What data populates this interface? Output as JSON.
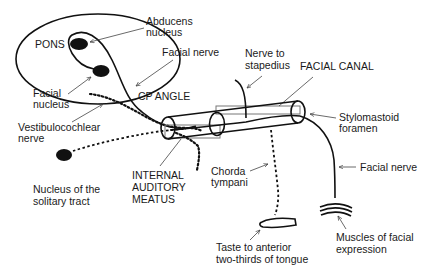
{
  "diagram": {
    "labels": {
      "pons": "PONS",
      "abducens_1": "Abducens",
      "abducens_2": "nucleus",
      "facial_nerve_top": "Facial nerve",
      "facial_nucleus_1": "Facial",
      "facial_nucleus_2": "nucleus",
      "cp_angle": "CP ANGLE",
      "vestibulocochlear_1": "Vestibulocochlear",
      "vestibulocochlear_2": "nerve",
      "solitary_1": "Nucleus of the",
      "solitary_2": "solitary tract",
      "iam_1": "INTERNAL",
      "iam_2": "AUDITORY",
      "iam_3": "MEATUS",
      "stapedius_1": "Nerve to",
      "stapedius_2": "stapedius",
      "facial_canal": "FACIAL CANAL",
      "stylomastoid_1": "Stylomastoid",
      "stylomastoid_2": "foramen",
      "chorda_1": "Chorda",
      "chorda_2": "tympani",
      "facial_nerve_right": "Facial nerve",
      "taste_1": "Taste to anterior",
      "taste_2": "two-thirds of tongue",
      "muscles_1": "Muscles of facial",
      "muscles_2": "expression"
    },
    "colors": {
      "line": "#111111",
      "leader": "#444444",
      "canal_box": "#777777",
      "text": "#1a1a1a",
      "background": "#ffffff"
    }
  }
}
